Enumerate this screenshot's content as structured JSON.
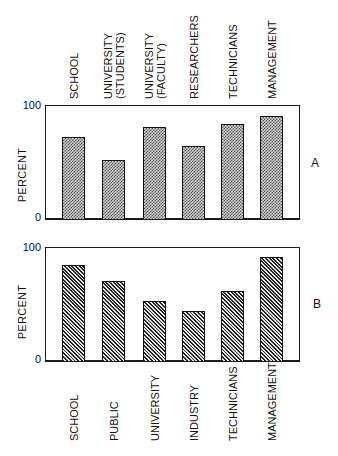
{
  "chart_data": [
    {
      "panel": "A",
      "type": "bar",
      "title": "",
      "xlabel": "",
      "ylabel": "PERCENT",
      "ylim": [
        0,
        100
      ],
      "yticks": [
        "0",
        "100"
      ],
      "grid": false,
      "legend": null,
      "label_position": "top",
      "fill_pattern": "stipple",
      "categories": [
        "SCHOOL",
        "UNIVERSITY (STUDENTS)",
        "UNIVERSITY (FACULTY)",
        "RESEARCHERS",
        "TECHNICIANS",
        "MANAGEMENT"
      ],
      "category_lines": [
        [
          "SCHOOL"
        ],
        [
          "UNIVERSITY",
          "(STUDENTS)"
        ],
        [
          "UNIVERSITY",
          "(FACULTY)"
        ],
        [
          "RESEARCHERS"
        ],
        [
          "TECHNICIANS"
        ],
        [
          "MANAGEMENT"
        ]
      ],
      "values": [
        72,
        52,
        81,
        64,
        83,
        90
      ]
    },
    {
      "panel": "B",
      "type": "bar",
      "title": "",
      "xlabel": "",
      "ylabel": "PERCENT",
      "ylim": [
        0,
        100
      ],
      "yticks": [
        "0",
        "100"
      ],
      "grid": false,
      "legend": null,
      "label_position": "bottom",
      "fill_pattern": "diagonal-hatch",
      "categories": [
        "SCHOOL",
        "PUBLIC",
        "UNIVERSITY",
        "INDUSTRY",
        "TECHNICIANS",
        "MANAGEMENT"
      ],
      "category_lines": [
        [
          "SCHOOL"
        ],
        [
          "PUBLIC"
        ],
        [
          "UNIVERSITY"
        ],
        [
          "INDUSTRY"
        ],
        [
          "TECHNICIANS"
        ],
        [
          "MANAGEMENT"
        ]
      ],
      "values": [
        84,
        70,
        53,
        44,
        61,
        91
      ]
    }
  ],
  "panels": {
    "a": {
      "label": "A",
      "ylabel": "PERCENT",
      "ytick_top": "100",
      "ytick_bottom": "0"
    },
    "b": {
      "label": "B",
      "ylabel": "PERCENT",
      "ytick_top": "100",
      "ytick_bottom": "0"
    }
  },
  "colors": {
    "ink": "#111111",
    "background": "#ffffff",
    "stipple_fill": "#9a9a9a",
    "hatch_fill": "#555555"
  }
}
